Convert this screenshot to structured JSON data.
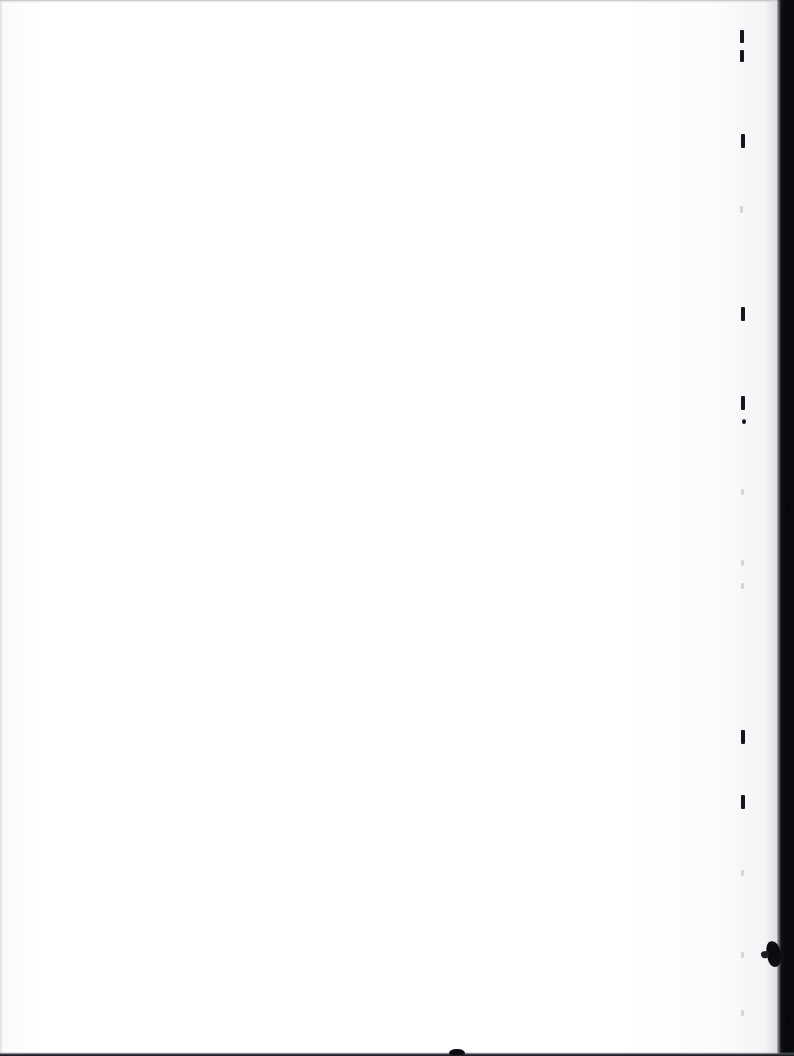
{
  "document": {
    "kind": "scanned-page",
    "page_state": "blank",
    "body_text": "",
    "width_px": 794,
    "height_px": 1056
  },
  "colors": {
    "paper": "#ffffff",
    "ink": "#15171c",
    "scan_band": "#05070a",
    "edge_top": "#b0b0b4",
    "edge_bottom": "#14161a",
    "faint_mark": "#aaacb2"
  },
  "artifacts": {
    "top_edge": {
      "label": "top scan edge line"
    },
    "bottom_edge": {
      "label": "bottom scan edge line"
    },
    "bottom_blob": {
      "label": "bottom edge speck"
    },
    "left_edge": {
      "label": "left scan edge line"
    },
    "right_band": {
      "label": "right scanner shadow band"
    },
    "right_band_blob": {
      "label": "right band speck"
    },
    "tick_marks": [
      {
        "name": "tick-1",
        "x": 740,
        "y": 30,
        "w": 4,
        "h": 13,
        "style": "solid"
      },
      {
        "name": "tick-2",
        "x": 740,
        "y": 50,
        "w": 4,
        "h": 12,
        "style": "solid"
      },
      {
        "name": "tick-3",
        "x": 741,
        "y": 134,
        "w": 4,
        "h": 14,
        "style": "solid"
      },
      {
        "name": "tick-4",
        "x": 740,
        "y": 206,
        "w": 3,
        "h": 7,
        "style": "faint"
      },
      {
        "name": "tick-5",
        "x": 741,
        "y": 307,
        "w": 4,
        "h": 14,
        "style": "solid"
      },
      {
        "name": "tick-6",
        "x": 741,
        "y": 396,
        "w": 4,
        "h": 14,
        "style": "solid"
      },
      {
        "name": "tick-7",
        "x": 742,
        "y": 419,
        "w": 4,
        "h": 5,
        "style": "dot"
      },
      {
        "name": "tick-8",
        "x": 741,
        "y": 489,
        "w": 3,
        "h": 6,
        "style": "faint"
      },
      {
        "name": "tick-9",
        "x": 741,
        "y": 560,
        "w": 3,
        "h": 6,
        "style": "faint"
      },
      {
        "name": "tick-10",
        "x": 741,
        "y": 583,
        "w": 3,
        "h": 6,
        "style": "faint"
      },
      {
        "name": "tick-11",
        "x": 741,
        "y": 730,
        "w": 4,
        "h": 14,
        "style": "solid"
      },
      {
        "name": "tick-12",
        "x": 741,
        "y": 795,
        "w": 4,
        "h": 14,
        "style": "solid"
      },
      {
        "name": "tick-13",
        "x": 741,
        "y": 870,
        "w": 3,
        "h": 6,
        "style": "faint"
      },
      {
        "name": "tick-14",
        "x": 741,
        "y": 952,
        "w": 3,
        "h": 6,
        "style": "faint"
      },
      {
        "name": "tick-15",
        "x": 741,
        "y": 1010,
        "w": 3,
        "h": 6,
        "style": "faint"
      }
    ]
  }
}
